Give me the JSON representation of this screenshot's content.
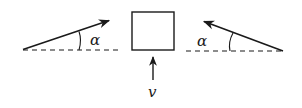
{
  "diagram": {
    "box": {
      "x": 132,
      "y": 12,
      "w": 42,
      "h": 38
    },
    "velocity": {
      "label": "v",
      "direction": "up"
    },
    "left_force": {
      "angle_label": "α",
      "direction": "up-right"
    },
    "right_force": {
      "angle_label": "α",
      "direction": "up-left"
    }
  },
  "colors": {
    "stroke": "#1a1a1a",
    "background": "#ffffff"
  }
}
